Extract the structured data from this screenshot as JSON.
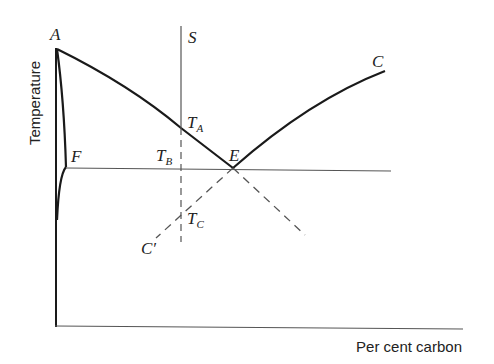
{
  "diagram": {
    "type": "phase-diagram",
    "axes": {
      "x_label": "Per cent carbon",
      "y_label": "Temperature"
    },
    "points": {
      "A": "A",
      "C": "C",
      "C_prime": "C′",
      "E": "E",
      "F": "F",
      "S": "S",
      "TA": {
        "main": "T",
        "sub": "A"
      },
      "TB": {
        "main": "T",
        "sub": "B"
      },
      "TC": {
        "main": "T",
        "sub": "C"
      }
    },
    "colors": {
      "line": "#1a1a1a",
      "thin_line": "#555555",
      "background": "#ffffff"
    }
  }
}
